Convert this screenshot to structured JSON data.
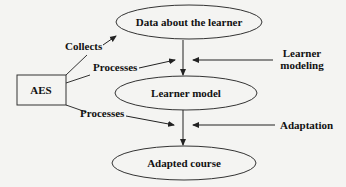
{
  "diagram": {
    "nodes": {
      "aes": {
        "label": "AES",
        "shape": "rectangle"
      },
      "data_about_learner": {
        "label": "Data about the learner",
        "shape": "ellipse"
      },
      "learner_model": {
        "label": "Learner model",
        "shape": "ellipse"
      },
      "adapted_course": {
        "label": "Adapted course",
        "shape": "ellipse"
      }
    },
    "edge_labels": {
      "collects": "Collects",
      "processes_1": "Processes",
      "processes_2": "Processes",
      "learner_modeling_line1": "Learner",
      "learner_modeling_line2": "modeling",
      "adaptation": "Adaptation"
    },
    "edges": [
      {
        "from": "AES",
        "to": "Data about the learner",
        "label": "Collects"
      },
      {
        "from": "AES",
        "to": "Data→Learner model flow",
        "label": "Processes"
      },
      {
        "from": "Data about the learner",
        "to": "Learner model",
        "label": "Learner modeling"
      },
      {
        "from": "AES",
        "to": "Learner model→Adapted course flow",
        "label": "Processes"
      },
      {
        "from": "Learner model",
        "to": "Adapted course",
        "label": "Adaptation"
      }
    ],
    "colors": {
      "stroke": "#222222",
      "background": "#f4f4f2"
    }
  }
}
